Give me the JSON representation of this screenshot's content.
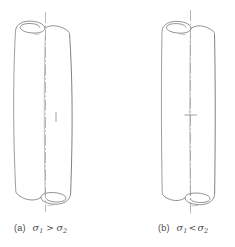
{
  "figure": {
    "background_color": "#ffffff",
    "line_color": "#8c8c8c",
    "line_color_dark": "#6e6e6e",
    "centerline_color": "#9a9a9a",
    "text_color": "#4a4a4a",
    "width": 235,
    "height": 247
  },
  "panels": [
    {
      "id": "a",
      "tag": "(a)",
      "sigma_first": "σ",
      "sub_first": "1",
      "relation": ">",
      "sigma_second": "σ",
      "sub_second": "2",
      "caption_full": "(a)  σ₁ > σ₂",
      "description": "rolled-sheet cylinder, barrelled / bulged profile",
      "axis_label": "cylinder-axis-centerline",
      "end_detail": "spiral rolled edge"
    },
    {
      "id": "b",
      "tag": "(b)",
      "sigma_first": "σ",
      "sub_first": "1",
      "relation": "<",
      "sigma_second": "σ",
      "sub_second": "2",
      "caption_full": "(b)  σ₁ < σ₂",
      "description": "rolled-sheet cylinder, waisted / straight profile",
      "axis_label": "cylinder-axis-centerline",
      "end_detail": "spiral rolled edge"
    }
  ]
}
